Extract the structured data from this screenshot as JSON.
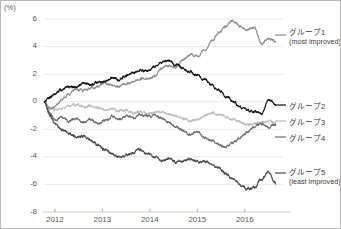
{
  "axes": {
    "unit_label": "(%)",
    "y_ticks": [
      "6",
      "4",
      "2",
      "0",
      "-2",
      "-4",
      "-6",
      "-8"
    ],
    "y_tick_values": [
      6,
      4,
      2,
      0,
      -2,
      -4,
      -6,
      -8
    ],
    "x_ticks": [
      "2012",
      "2013",
      "2014",
      "2015",
      "2016"
    ],
    "x_tick_values": [
      2012,
      2013,
      2014,
      2015,
      2016
    ]
  },
  "legend": [
    {
      "name": "グループ1",
      "sub": "(most improved)",
      "color": "#8e8e8e"
    },
    {
      "name": "グループ2",
      "sub": "",
      "color": "#111111"
    },
    {
      "name": "グループ3",
      "sub": "",
      "color": "#bdbdbd"
    },
    {
      "name": "グループ4",
      "sub": "",
      "color": "#6e6e6e"
    },
    {
      "name": "グループ5",
      "sub": "(least improved)",
      "color": "#4a4a4a"
    }
  ],
  "colors": {
    "grid": "#e6e6e6",
    "axis": "#cfcfcf",
    "text": "#5a5a5a",
    "background": "#ffffff"
  },
  "chart_data": {
    "type": "line",
    "title": "",
    "subtitle": "",
    "xlabel": "",
    "ylabel": "(%)",
    "xlim": [
      2011.75,
      2016.72
    ],
    "ylim": [
      -8,
      6
    ],
    "grid": true,
    "legend_position": "right",
    "x_tick_labels": [
      "2012",
      "2013",
      "2014",
      "2015",
      "2016"
    ],
    "y_tick_labels": [
      "6",
      "4",
      "2",
      "0",
      "-2",
      "-4",
      "-6",
      "-8"
    ],
    "x_sample_step": 0.02,
    "series": [
      {
        "name": "グループ1",
        "annotation": "most improved",
        "color": "#8e8e8e",
        "x": [
          2011.78,
          2011.9,
          2012.0,
          2012.15,
          2012.3,
          2012.45,
          2012.6,
          2012.75,
          2012.9,
          2013.05,
          2013.2,
          2013.35,
          2013.5,
          2013.65,
          2013.8,
          2013.95,
          2014.1,
          2014.25,
          2014.4,
          2014.55,
          2014.7,
          2014.85,
          2015.0,
          2015.15,
          2015.3,
          2015.45,
          2015.6,
          2015.75,
          2015.9,
          2016.05,
          2016.2,
          2016.35,
          2016.5,
          2016.65
        ],
        "values": [
          0.0,
          -0.5,
          -0.4,
          0.2,
          0.6,
          0.9,
          0.8,
          1.0,
          1.1,
          1.3,
          1.2,
          1.1,
          1.3,
          1.5,
          1.7,
          1.6,
          1.9,
          2.4,
          2.6,
          2.5,
          3.0,
          3.4,
          3.3,
          3.8,
          4.4,
          5.0,
          5.5,
          5.9,
          5.5,
          5.2,
          5.4,
          4.2,
          4.6,
          4.4
        ]
      },
      {
        "name": "グループ2",
        "annotation": "",
        "color": "#111111",
        "x": [
          2011.78,
          2011.9,
          2012.0,
          2012.15,
          2012.3,
          2012.45,
          2012.6,
          2012.75,
          2012.9,
          2013.05,
          2013.2,
          2013.35,
          2013.5,
          2013.65,
          2013.8,
          2013.95,
          2014.1,
          2014.25,
          2014.4,
          2014.55,
          2014.7,
          2014.85,
          2015.0,
          2015.15,
          2015.3,
          2015.45,
          2015.6,
          2015.75,
          2015.9,
          2016.05,
          2016.2,
          2016.35,
          2016.5,
          2016.65
        ],
        "values": [
          0.0,
          0.3,
          0.6,
          0.9,
          1.1,
          1.0,
          1.3,
          1.2,
          1.4,
          1.5,
          1.7,
          1.6,
          1.9,
          2.1,
          2.3,
          2.2,
          2.6,
          2.8,
          3.0,
          2.7,
          2.4,
          2.2,
          1.9,
          1.6,
          1.2,
          0.9,
          0.4,
          0.0,
          -0.4,
          -0.6,
          -0.7,
          -0.9,
          0.1,
          -0.2
        ]
      },
      {
        "name": "グループ3",
        "annotation": "",
        "color": "#bdbdbd",
        "x": [
          2011.78,
          2011.9,
          2012.0,
          2012.15,
          2012.3,
          2012.45,
          2012.6,
          2012.75,
          2012.9,
          2013.05,
          2013.2,
          2013.35,
          2013.5,
          2013.65,
          2013.8,
          2013.95,
          2014.1,
          2014.25,
          2014.4,
          2014.55,
          2014.7,
          2014.85,
          2015.0,
          2015.15,
          2015.3,
          2015.45,
          2015.6,
          2015.75,
          2015.9,
          2016.05,
          2016.2,
          2016.35,
          2016.5,
          2016.65
        ],
        "values": [
          0.0,
          -0.4,
          -0.6,
          -0.5,
          -0.3,
          -0.2,
          -0.4,
          -0.3,
          -0.5,
          -0.6,
          -0.5,
          -0.7,
          -0.6,
          -0.8,
          -0.7,
          -0.9,
          -0.8,
          -0.7,
          -0.9,
          -1.0,
          -1.2,
          -1.4,
          -1.3,
          -1.0,
          -0.8,
          -0.9,
          -1.1,
          -1.3,
          -1.5,
          -1.7,
          -1.6,
          -1.5,
          -1.4,
          -1.6
        ]
      },
      {
        "name": "グループ4",
        "annotation": "",
        "color": "#6e6e6e",
        "x": [
          2011.78,
          2011.9,
          2012.0,
          2012.15,
          2012.3,
          2012.45,
          2012.6,
          2012.75,
          2012.9,
          2013.05,
          2013.2,
          2013.35,
          2013.5,
          2013.65,
          2013.8,
          2013.95,
          2014.1,
          2014.25,
          2014.4,
          2014.55,
          2014.7,
          2014.85,
          2015.0,
          2015.15,
          2015.3,
          2015.45,
          2015.6,
          2015.75,
          2015.9,
          2016.05,
          2016.2,
          2016.35,
          2016.5,
          2016.65
        ],
        "values": [
          0.0,
          -0.8,
          -1.3,
          -1.1,
          -1.4,
          -1.2,
          -1.5,
          -1.3,
          -1.6,
          -1.4,
          -1.1,
          -1.3,
          -1.0,
          -1.2,
          -0.9,
          -1.1,
          -1.0,
          -1.2,
          -1.5,
          -1.8,
          -2.1,
          -2.4,
          -2.2,
          -2.6,
          -2.8,
          -3.1,
          -3.3,
          -3.0,
          -2.6,
          -2.2,
          -1.8,
          -1.6,
          -1.9,
          -1.7
        ]
      },
      {
        "name": "グループ5",
        "annotation": "least improved",
        "color": "#4a4a4a",
        "x": [
          2011.78,
          2011.9,
          2012.0,
          2012.15,
          2012.3,
          2012.45,
          2012.6,
          2012.75,
          2012.9,
          2013.05,
          2013.2,
          2013.35,
          2013.5,
          2013.65,
          2013.8,
          2013.95,
          2014.1,
          2014.25,
          2014.4,
          2014.55,
          2014.7,
          2014.85,
          2015.0,
          2015.15,
          2015.3,
          2015.45,
          2015.6,
          2015.75,
          2015.9,
          2016.05,
          2016.2,
          2016.35,
          2016.5,
          2016.65
        ],
        "values": [
          0.0,
          -1.0,
          -1.6,
          -2.0,
          -2.3,
          -2.6,
          -2.5,
          -2.8,
          -3.1,
          -3.5,
          -3.8,
          -4.0,
          -3.9,
          -3.7,
          -3.5,
          -3.8,
          -4.0,
          -4.3,
          -4.1,
          -4.4,
          -4.3,
          -4.2,
          -4.4,
          -4.3,
          -4.5,
          -4.8,
          -5.2,
          -5.6,
          -6.0,
          -6.3,
          -6.2,
          -5.6,
          -5.1,
          -5.9
        ]
      }
    ]
  }
}
